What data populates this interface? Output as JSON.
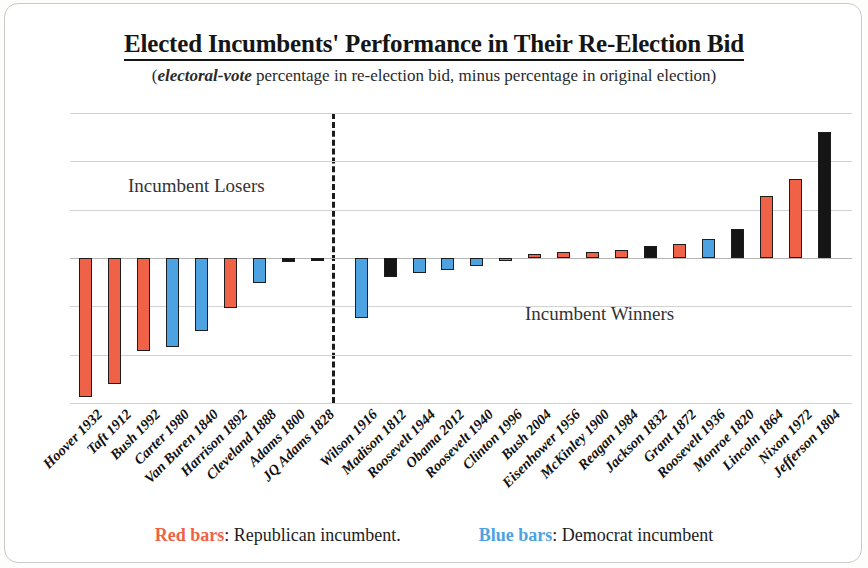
{
  "header": {
    "title": "Elected Incumbents' Performance in Their Re-Election Bid",
    "subtitle_emphasis": "electoral-vote",
    "subtitle_rest": " percentage in re-election bid, minus percentage in original election)",
    "subtitle_open": "("
  },
  "annotations": {
    "losers": "Incumbent Losers",
    "winners": "Incumbent Winners"
  },
  "legend": {
    "red_label": "Red bars",
    "red_text": ":  Republican incumbent.",
    "blue_label": "Blue bars",
    "blue_text": ":  Democrat incumbent"
  },
  "colors": {
    "republican": "#ef6248",
    "democrat": "#4da2e2",
    "other": "#151515",
    "gridline": "#d2d2d2"
  },
  "chart_data": {
    "type": "bar",
    "title": "Elected Incumbents' Performance in Their Re-Election Bid",
    "subtitle": "(electoral-vote percentage in re-election bid, minus percentage in original election)",
    "xlabel": "",
    "ylabel": "",
    "ylim": [
      -75,
      75
    ],
    "yticks": [
      75,
      50,
      25,
      0,
      -25,
      -50,
      -75
    ],
    "ytick_labels": [
      "75%",
      "50%",
      "25%",
      "0%",
      "-25%",
      "-50%",
      "-75%"
    ],
    "grid": true,
    "legend_position": "bottom",
    "group_divider_after_index": 8,
    "categories": [
      "Hoover 1932",
      "Taft 1912",
      "Bush 1992",
      "Carter 1980",
      "Van Buren 1840",
      "Harrison 1892",
      "Cleveland 1888",
      "Adams 1800",
      "JQ Adams 1828",
      "Wilson 1916",
      "Madison 1812",
      "Roosevelt 1944",
      "Obama 2012",
      "Roosevelt 1940",
      "Clinton 1996",
      "Bush 2004",
      "Eisenhower 1956",
      "McKinley 1900",
      "Reagan 1984",
      "Jackson 1832",
      "Grant 1872",
      "Roosevelt 1936",
      "Monroe 1820",
      "Lincoln 1864",
      "Nixon 1972",
      "Jefferson 1804"
    ],
    "values": [
      -72,
      -65,
      -48,
      -46,
      -38,
      -26,
      -13,
      -2,
      -1,
      -31,
      -10,
      -8,
      -6,
      -4,
      -1,
      2,
      3,
      3,
      4,
      6,
      7,
      10,
      15,
      32,
      41,
      65
    ],
    "party": [
      "republican",
      "republican",
      "republican",
      "democrat",
      "democrat",
      "republican",
      "democrat",
      "other",
      "other",
      "democrat",
      "other",
      "democrat",
      "democrat",
      "democrat",
      "democrat",
      "republican",
      "republican",
      "republican",
      "republican",
      "other",
      "republican",
      "democrat",
      "other",
      "republican",
      "republican",
      "other"
    ],
    "groups": [
      "Incumbent Losers",
      "Incumbent Losers",
      "Incumbent Losers",
      "Incumbent Losers",
      "Incumbent Losers",
      "Incumbent Losers",
      "Incumbent Losers",
      "Incumbent Losers",
      "Incumbent Losers",
      "Incumbent Winners",
      "Incumbent Winners",
      "Incumbent Winners",
      "Incumbent Winners",
      "Incumbent Winners",
      "Incumbent Winners",
      "Incumbent Winners",
      "Incumbent Winners",
      "Incumbent Winners",
      "Incumbent Winners",
      "Incumbent Winners",
      "Incumbent Winners",
      "Incumbent Winners",
      "Incumbent Winners",
      "Incumbent Winners",
      "Incumbent Winners",
      "Incumbent Winners"
    ]
  }
}
